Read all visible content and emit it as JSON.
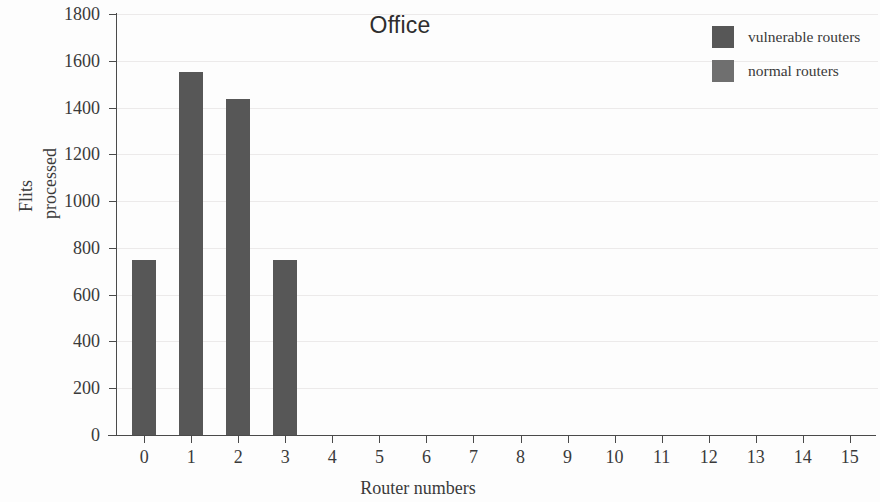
{
  "chart_data": {
    "type": "bar",
    "title": "Office",
    "xlabel": "Router numbers",
    "ylabel": "Flits processed",
    "ylabel_lines": [
      "Flits",
      "processed"
    ],
    "categories": [
      "0",
      "1",
      "2",
      "3",
      "4",
      "5",
      "6",
      "7",
      "8",
      "9",
      "10",
      "11",
      "12",
      "13",
      "14",
      "15"
    ],
    "series": [
      {
        "name": "vulnerable routers",
        "color": "#575757",
        "values": [
          750,
          1550,
          1435,
          750,
          0,
          0,
          0,
          0,
          0,
          0,
          0,
          0,
          0,
          0,
          0,
          0
        ]
      },
      {
        "name": "normal routers",
        "color": "#6f6f6f",
        "values": [
          0,
          0,
          0,
          0,
          0,
          0,
          0,
          0,
          0,
          0,
          0,
          0,
          0,
          0,
          0,
          0
        ]
      }
    ],
    "ylim": [
      0,
      1800
    ],
    "yticks": [
      0,
      200,
      400,
      600,
      800,
      1000,
      1200,
      1400,
      1600,
      1800
    ],
    "xlim": [
      -0.6,
      15.6
    ],
    "grid": true,
    "grid_axis": "y",
    "legend_position": "top-right"
  },
  "legend": {
    "entries": [
      {
        "label": "vulnerable routers",
        "color": "#575757"
      },
      {
        "label": "normal routers",
        "color": "#6f6f6f"
      }
    ]
  },
  "axes": {
    "y_title_line1": "Flits",
    "y_title_line2": "processed",
    "x_title": "Router numbers"
  }
}
